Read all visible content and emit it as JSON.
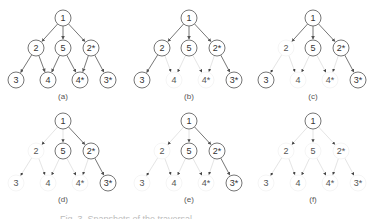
{
  "figure": {
    "nodes": [
      {
        "id": "1",
        "label": "1",
        "x": 63,
        "y": 18
      },
      {
        "id": "2",
        "label": "2",
        "x": 36,
        "y": 48
      },
      {
        "id": "5",
        "label": "5",
        "x": 63,
        "y": 48
      },
      {
        "id": "2s",
        "label": "2*",
        "x": 91,
        "y": 48
      },
      {
        "id": "3",
        "label": "3",
        "x": 16,
        "y": 80
      },
      {
        "id": "4",
        "label": "4",
        "x": 48,
        "y": 80
      },
      {
        "id": "4s",
        "label": "4*",
        "x": 80,
        "y": 80
      },
      {
        "id": "3s",
        "label": "3*",
        "x": 108,
        "y": 80
      }
    ],
    "edges": [
      [
        "1",
        "2"
      ],
      [
        "1",
        "5"
      ],
      [
        "1",
        "2s"
      ],
      [
        "2",
        "3"
      ],
      [
        "2",
        "4"
      ],
      [
        "5",
        "4"
      ],
      [
        "5",
        "4s"
      ],
      [
        "2s",
        "4s"
      ],
      [
        "2s",
        "3s"
      ]
    ],
    "panels": [
      {
        "label": "(a)",
        "dx": 0,
        "dy": 0,
        "active_nodes": [
          "1",
          "2",
          "5",
          "2s",
          "3",
          "4",
          "4s",
          "3s"
        ],
        "active_edges": [
          0,
          1,
          2,
          3,
          4,
          5,
          6,
          7,
          8
        ]
      },
      {
        "label": "(b)",
        "dx": 126,
        "dy": 0,
        "active_nodes": [
          "1",
          "2",
          "5",
          "2s",
          "3",
          "3s"
        ],
        "active_edges": [
          0,
          1,
          2,
          3,
          8
        ]
      },
      {
        "label": "(c)",
        "dx": 250,
        "dy": 0,
        "active_nodes": [
          "1",
          "5",
          "2s",
          "3",
          "3s"
        ],
        "active_edges": [
          0,
          1,
          2,
          8
        ]
      },
      {
        "label": "(d)",
        "dx": 0,
        "dy": 103,
        "active_nodes": [
          "1",
          "5",
          "2s",
          "3s"
        ],
        "active_edges": [
          2,
          8
        ]
      },
      {
        "label": "(e)",
        "dx": 126,
        "dy": 103,
        "active_nodes": [
          "1",
          "5",
          "2s",
          "3s"
        ],
        "active_edges": [
          2,
          8
        ]
      },
      {
        "label": "(f)",
        "dx": 250,
        "dy": 103,
        "active_nodes": [
          "1"
        ],
        "active_edges": []
      }
    ],
    "colors": {
      "active_stroke": "#666666",
      "faint_stroke": "#dddddd",
      "active_text": "#333333",
      "faint_text": "#555555"
    }
  },
  "caption": "Fig. 3. Snapshots of the traversal"
}
